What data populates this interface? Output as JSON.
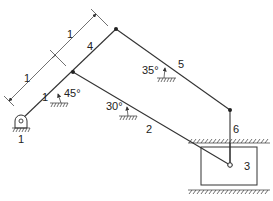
{
  "diagram": {
    "type": "planar-linkage-mechanism",
    "links": [
      {
        "id": "1",
        "label": "1",
        "role": "ground"
      },
      {
        "id": "2",
        "label": "2",
        "role": "connecting rod"
      },
      {
        "id": "3",
        "label": "3",
        "role": "slider"
      },
      {
        "id": "4",
        "label": "4",
        "role": "crank extension"
      },
      {
        "id": "5",
        "label": "5",
        "role": "coupler"
      },
      {
        "id": "6",
        "label": "6",
        "role": "vertical link"
      }
    ],
    "dimensions": [
      {
        "label": "1",
        "segment": "lower"
      },
      {
        "label": "1",
        "segment": "upper"
      }
    ],
    "angles": [
      {
        "label": "45°",
        "at": "crank"
      },
      {
        "label": "30°",
        "at": "link 2"
      },
      {
        "label": "35°",
        "at": "link 5"
      }
    ],
    "label_text": {
      "link1_num": "1",
      "ground_num": "1",
      "link2": "2",
      "link3": "3",
      "link4": "4",
      "link5": "5",
      "link6": "6",
      "dim_lower": "1",
      "dim_upper": "1",
      "angle45": "45°",
      "angle30": "30°",
      "angle35": "35°"
    }
  }
}
